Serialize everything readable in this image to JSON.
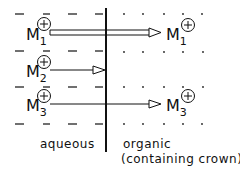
{
  "diagram": {
    "interface_label_left": "aqueous",
    "interface_label_right_line1": "organic",
    "interface_label_right_line2": "(containing crown)",
    "aqueous_marker": "—",
    "organic_marker": "·",
    "ions": [
      {
        "symbol": "M",
        "index": "1",
        "charge": "+",
        "transfer": "full",
        "arrow_style": "double"
      },
      {
        "symbol": "M",
        "index": "2",
        "charge": "+",
        "transfer": "blocked at interface",
        "arrow_style": "single"
      },
      {
        "symbol": "M",
        "index": "3",
        "charge": "+",
        "transfer": "full",
        "arrow_style": "single"
      }
    ],
    "targets": [
      {
        "symbol": "M",
        "index": "1",
        "charge": "+"
      },
      {
        "symbol": "M",
        "index": "3",
        "charge": "+"
      }
    ]
  }
}
